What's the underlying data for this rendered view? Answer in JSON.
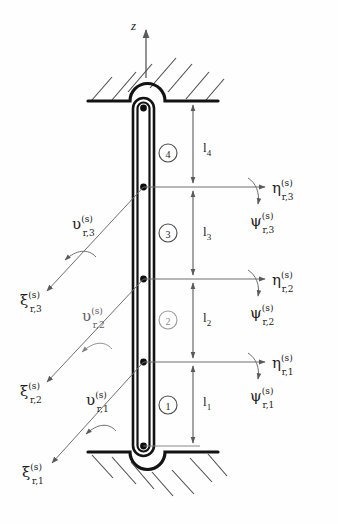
{
  "figure": {
    "type": "engineering-schematic",
    "background_color": "#fefefe",
    "ink_color": "#1c1c1c",
    "thin_line_color": "#5a5a5a"
  },
  "axis": {
    "label": "z",
    "direction": "up",
    "name": "vertical-axis-z"
  },
  "supports": {
    "top": {
      "name": "top-fixed-support",
      "hatch_direction": "up-right",
      "bump": "convex-up-semicircle"
    },
    "bottom": {
      "name": "bottom-fixed-support",
      "hatch_direction": "down-right",
      "bump": "convex-down-semicircle"
    }
  },
  "beam": {
    "name": "flexible-rod",
    "orientation": "vertical",
    "node_count": 5
  },
  "segments": [
    {
      "id": "4",
      "label": "4",
      "length_label": "l",
      "length_sub": "4"
    },
    {
      "id": "3",
      "label": "3",
      "length_label": "l",
      "length_sub": "3"
    },
    {
      "id": "2",
      "label": "2",
      "length_label": "l",
      "length_sub": "2"
    },
    {
      "id": "1",
      "label": "1",
      "length_label": "l",
      "length_sub": "1"
    }
  ],
  "dimensions": [
    {
      "name": "dimension-l4",
      "base": "l",
      "sub": "4"
    },
    {
      "name": "dimension-l3",
      "base": "l",
      "sub": "3"
    },
    {
      "name": "dimension-l2",
      "base": "l",
      "sub": "2"
    },
    {
      "name": "dimension-l1",
      "base": "l",
      "sub": "1"
    }
  ],
  "right_labels": [
    {
      "name": "eta-r3",
      "base": "η",
      "sup": "(s)",
      "sub": "r,3"
    },
    {
      "name": "psi-r3",
      "base": "ψ",
      "sup": "(s)",
      "sub": "r,3"
    },
    {
      "name": "eta-r2",
      "base": "η",
      "sup": "(s)",
      "sub": "r,2"
    },
    {
      "name": "psi-r2",
      "base": "ψ",
      "sup": "(s)",
      "sub": "r,2"
    },
    {
      "name": "eta-r1",
      "base": "η",
      "sup": "(s)",
      "sub": "r,1"
    },
    {
      "name": "psi-r1",
      "base": "ψ",
      "sup": "(s)",
      "sub": "r,1"
    }
  ],
  "left_labels": [
    {
      "name": "upsilon-r3",
      "base": "υ",
      "sup": "(s)",
      "sub": "r,3"
    },
    {
      "name": "xi-r3",
      "base": "ξ",
      "sup": "(s)",
      "sub": "r,3"
    },
    {
      "name": "upsilon-r2",
      "base": "υ",
      "sup": "(s)",
      "sub": "r,2"
    },
    {
      "name": "xi-r2",
      "base": "ξ",
      "sup": "(s)",
      "sub": "r,2"
    },
    {
      "name": "upsilon-r1",
      "base": "υ",
      "sup": "(s)",
      "sub": "r,1"
    },
    {
      "name": "xi-r1",
      "base": "ξ",
      "sup": "(s)",
      "sub": "r,1"
    }
  ]
}
